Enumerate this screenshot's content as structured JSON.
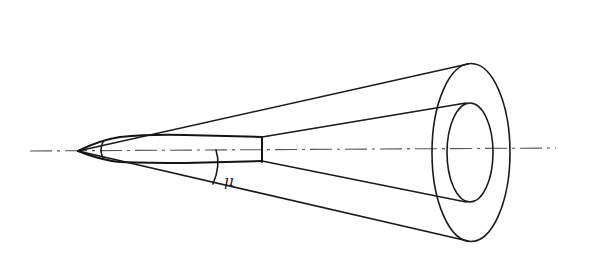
{
  "diagram": {
    "labels": {
      "mach_angle": "μ"
    },
    "colors": {
      "line": "#1a1a1a",
      "axis": "#555555",
      "background": "#ffffff"
    }
  }
}
